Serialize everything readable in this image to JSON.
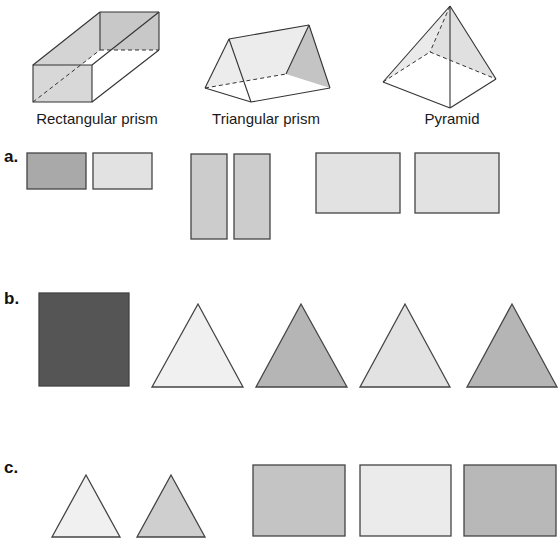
{
  "solids": [
    {
      "label": "Rectangular prism"
    },
    {
      "label": "Triangular prism"
    },
    {
      "label": "Pyramid"
    }
  ],
  "options": [
    {
      "label": "a.",
      "shapes": [
        {
          "type": "rect",
          "fill": "#a9a9a9"
        },
        {
          "type": "rect",
          "fill": "#e2e2e2"
        },
        {
          "type": "rect",
          "fill": "#cccccc"
        },
        {
          "type": "rect",
          "fill": "#cccccc"
        },
        {
          "type": "rect",
          "fill": "#e2e2e2"
        },
        {
          "type": "rect",
          "fill": "#e2e2e2"
        }
      ]
    },
    {
      "label": "b.",
      "shapes": [
        {
          "type": "square",
          "fill": "#555555"
        },
        {
          "type": "triangle",
          "fill": "#f0f0f0"
        },
        {
          "type": "triangle",
          "fill": "#b5b5b5"
        },
        {
          "type": "triangle",
          "fill": "#e2e2e2"
        },
        {
          "type": "triangle",
          "fill": "#b5b5b5"
        }
      ]
    },
    {
      "label": "c.",
      "shapes": [
        {
          "type": "triangle",
          "fill": "#f0f0f0"
        },
        {
          "type": "triangle",
          "fill": "#cfcfcf"
        },
        {
          "type": "rect",
          "fill": "#c4c4c4"
        },
        {
          "type": "rect",
          "fill": "#ebebeb"
        },
        {
          "type": "rect",
          "fill": "#b8b8b8"
        }
      ]
    }
  ]
}
